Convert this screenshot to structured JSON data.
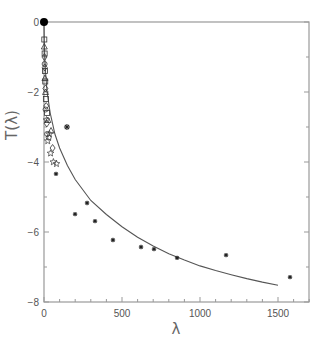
{
  "chart_data": {
    "type": "scatter",
    "title": "",
    "xlabel": "λ",
    "ylabel": "T(λ)",
    "xlim": [
      0,
      1700
    ],
    "ylim": [
      -8,
      0
    ],
    "x_ticks": [
      "0",
      "500",
      "1000",
      "1500"
    ],
    "y_ticks": [
      "0",
      "-2",
      "-4",
      "-6",
      "-8"
    ],
    "grid": false,
    "legend": null,
    "series": [
      {
        "name": "asterisk markers",
        "marker": "asterisk",
        "points": [
          [
            77,
            -4.34
          ],
          [
            199,
            -5.49
          ],
          [
            276,
            -5.17
          ],
          [
            327,
            -5.69
          ],
          [
            442,
            -6.23
          ],
          [
            622,
            -6.43
          ],
          [
            705,
            -6.49
          ],
          [
            853,
            -6.74
          ],
          [
            1167,
            -6.66
          ],
          [
            1577,
            -7.29
          ],
          [
            147,
            -3.0
          ]
        ]
      },
      {
        "name": "open squares",
        "marker": "square",
        "points": [
          [
            2,
            -0.5
          ],
          [
            4,
            -0.9
          ],
          [
            6,
            -1.4
          ],
          [
            8,
            -1.7
          ],
          [
            12,
            -2.2
          ],
          [
            20,
            -2.6
          ]
        ]
      },
      {
        "name": "open diamonds",
        "marker": "diamond",
        "points": [
          [
            3,
            -1.0
          ],
          [
            5,
            -1.3
          ],
          [
            9,
            -1.9
          ],
          [
            14,
            -2.4
          ],
          [
            18,
            -2.9
          ],
          [
            55,
            -3.6
          ]
        ]
      },
      {
        "name": "open triangles",
        "marker": "triangle",
        "points": [
          [
            2,
            -0.7
          ],
          [
            6,
            -1.6
          ],
          [
            10,
            -2.0
          ],
          [
            25,
            -2.8
          ],
          [
            45,
            -3.1
          ]
        ]
      },
      {
        "name": "open circles",
        "marker": "circle",
        "points": [
          [
            4,
            -1.2
          ],
          [
            10,
            -2.5
          ],
          [
            20,
            -3.2
          ],
          [
            30,
            -3.3
          ]
        ]
      },
      {
        "name": "open stars",
        "marker": "star",
        "points": [
          [
            16,
            -2.8
          ],
          [
            24,
            -3.4
          ],
          [
            35,
            -3.2
          ],
          [
            42,
            -3.75
          ],
          [
            60,
            -4.0
          ],
          [
            80,
            -4.05
          ]
        ]
      },
      {
        "name": "origin",
        "marker": "filled-circle",
        "points": [
          [
            0,
            0
          ]
        ]
      },
      {
        "name": "fit curve",
        "marker": "line",
        "points": [
          [
            0,
            0
          ],
          [
            2,
            -0.6
          ],
          [
            5,
            -1.0
          ],
          [
            10,
            -1.45
          ],
          [
            20,
            -2.0
          ],
          [
            40,
            -2.6
          ],
          [
            70,
            -3.2
          ],
          [
            100,
            -3.6
          ],
          [
            150,
            -4.1
          ],
          [
            200,
            -4.5
          ],
          [
            300,
            -5.1
          ],
          [
            400,
            -5.5
          ],
          [
            500,
            -5.85
          ],
          [
            600,
            -6.15
          ],
          [
            700,
            -6.4
          ],
          [
            800,
            -6.62
          ],
          [
            900,
            -6.8
          ],
          [
            1000,
            -6.97
          ],
          [
            1100,
            -7.1
          ],
          [
            1200,
            -7.22
          ],
          [
            1300,
            -7.33
          ],
          [
            1400,
            -7.43
          ],
          [
            1500,
            -7.52
          ]
        ]
      }
    ]
  },
  "plot": {
    "left": 44,
    "right": 309,
    "top": 22,
    "bottom": 302,
    "x_per_unit": 0.156,
    "y_per_unit": 35,
    "axis_color": "#999999",
    "curve_color": "#555555",
    "marker_color": "#333333"
  }
}
